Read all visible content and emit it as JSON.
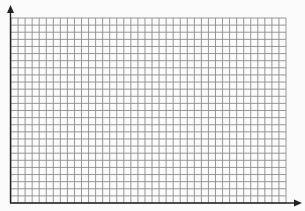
{
  "figure": {
    "background_color": "#fbfbfb",
    "grid": {
      "columns": 39,
      "rows": 26,
      "left": 11,
      "top": 18,
      "right": 286,
      "bottom": 203,
      "line_color": "#8c8c8c",
      "line_width": 0.9
    },
    "axes": {
      "color": "#222222",
      "line_width": 1.4,
      "y_axis": {
        "x": 10.5,
        "y_start": 203,
        "y_end": 5,
        "arrow": "up"
      },
      "x_axis": {
        "y": 203,
        "x_start": 10,
        "x_end": 302,
        "arrow": "right"
      }
    }
  }
}
